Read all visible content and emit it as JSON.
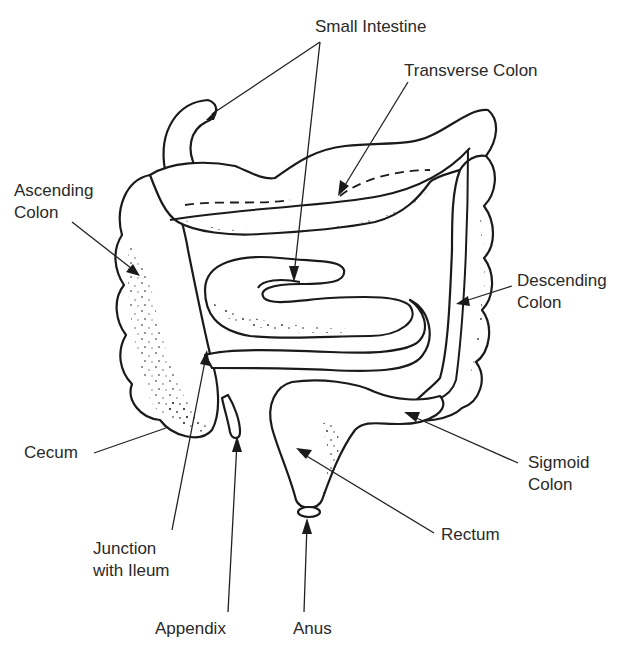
{
  "diagram": {
    "labels": {
      "small_intestine": "Small Intestine",
      "transverse_colon": "Transverse Colon",
      "ascending_colon": "Ascending\nColon",
      "descending_colon": "Descending\nColon",
      "cecum": "Cecum",
      "sigmoid_colon": "Sigmoid\nColon",
      "rectum": "Rectum",
      "junction_with_ileum": "Junction\nwith Ileum",
      "appendix": "Appendix",
      "anus": "Anus"
    },
    "colors": {
      "line": "#1a1a1a",
      "text": "#2a2a2a",
      "background": "#ffffff"
    }
  }
}
